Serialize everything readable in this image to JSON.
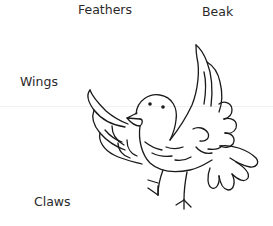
{
  "diagram": {
    "labels": {
      "feathers": "Feathers",
      "beak": "Beak",
      "wings": "Wings",
      "claws": "Claws"
    },
    "colors": {
      "background": "#ffffff",
      "text": "#2a2a2a",
      "stroke": "#1a1a1a"
    }
  }
}
